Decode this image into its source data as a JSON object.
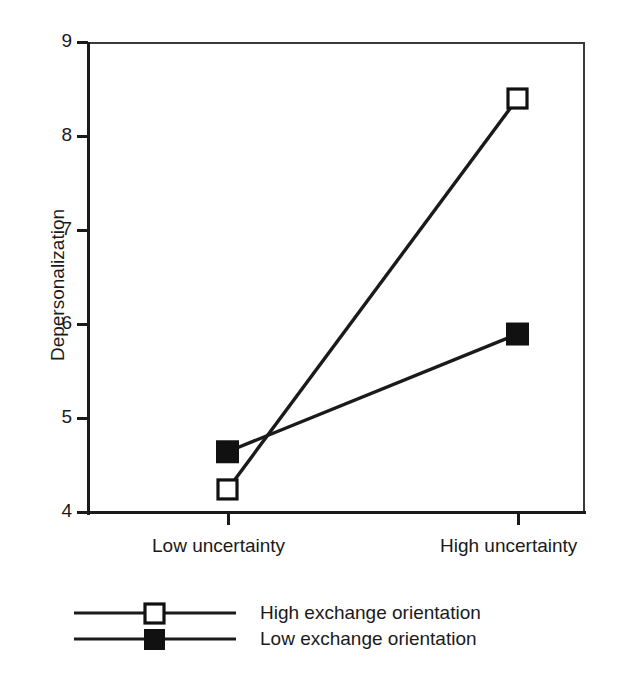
{
  "chart_data": {
    "type": "line",
    "title": "",
    "xlabel": "",
    "ylabel": "Depersonalization",
    "categories": [
      "Low uncertainty",
      "High uncertainty"
    ],
    "ylim": [
      4,
      9
    ],
    "yticks": [
      4,
      5,
      6,
      7,
      8,
      9
    ],
    "ytick_labels": [
      "4",
      "5",
      "6",
      "7",
      "8",
      "9"
    ],
    "grid": false,
    "legend_position": "below-plot-left",
    "series": [
      {
        "name": "High exchange orientation",
        "marker": "open-square",
        "values": [
          4.25,
          8.4
        ]
      },
      {
        "name": "Low exchange orientation",
        "marker": "filled-square",
        "values": [
          4.65,
          5.9
        ]
      }
    ],
    "colors": {
      "line": "#1a1a1a",
      "frame": "#3a3a3a",
      "marker_fill_open": "#ffffff",
      "marker_fill_closed": "#111111",
      "background": "#ffffff"
    }
  },
  "axis": {
    "y_title": "Depersonalization",
    "y_labels": [
      "9",
      "8",
      "7",
      "6",
      "5",
      "4"
    ],
    "x_labels": [
      "Low uncertainty",
      "High uncertainty"
    ]
  },
  "legend": {
    "items": [
      {
        "label": "High exchange orientation",
        "marker": "open-square"
      },
      {
        "label": "Low exchange orientation",
        "marker": "filled-square"
      }
    ]
  }
}
